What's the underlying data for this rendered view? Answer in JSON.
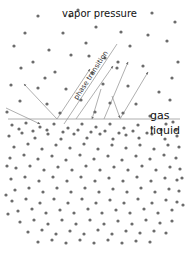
{
  "figure": {
    "width": 188,
    "height": 261,
    "background": "#ffffff",
    "title": "vapor pressure",
    "labels": {
      "title": "vapor pressure",
      "gas": "gas",
      "liquid": "liquid",
      "phase_transition": "phase transition"
    },
    "colors": {
      "particle": "#6b6b6b",
      "line": "#8d8d8d",
      "interface": "#9a9a9a",
      "text": "#111111",
      "background": "#ffffff"
    },
    "interface": {
      "name": "gas-liquid-interface",
      "y": 119,
      "x_start": 8,
      "x_end": 180
    },
    "particle_radius": 1.6,
    "gas_particles": [
      [
        38,
        16
      ],
      [
        70,
        16
      ],
      [
        152,
        13
      ],
      [
        25,
        33
      ],
      [
        63,
        33
      ],
      [
        121,
        32
      ],
      [
        148,
        35
      ],
      [
        175,
        22
      ],
      [
        49,
        50
      ],
      [
        86,
        43
      ],
      [
        105,
        58
      ],
      [
        167,
        41
      ],
      [
        14,
        46
      ],
      [
        33,
        62
      ],
      [
        130,
        46
      ],
      [
        178,
        62
      ],
      [
        78,
        10
      ],
      [
        96,
        27
      ],
      [
        21,
        68
      ],
      [
        55,
        72
      ],
      [
        92,
        73
      ],
      [
        117,
        68
      ],
      [
        143,
        66
      ],
      [
        172,
        78
      ],
      [
        11,
        85
      ],
      [
        38,
        88
      ],
      [
        66,
        89
      ],
      [
        103,
        84
      ],
      [
        128,
        86
      ],
      [
        159,
        92
      ],
      [
        20,
        101
      ],
      [
        47,
        104
      ],
      [
        81,
        100
      ],
      [
        110,
        103
      ],
      [
        136,
        104
      ],
      [
        170,
        100
      ],
      [
        7,
        112
      ],
      [
        60,
        113
      ],
      [
        95,
        112
      ],
      [
        123,
        113
      ],
      [
        150,
        116
      ],
      [
        118,
        62
      ],
      [
        89,
        56
      ],
      [
        45,
        78
      ],
      [
        71,
        55
      ]
    ],
    "liquid_particles": [
      [
        12,
        125
      ],
      [
        26,
        123
      ],
      [
        40,
        127
      ],
      [
        54,
        124
      ],
      [
        68,
        128
      ],
      [
        82,
        124
      ],
      [
        96,
        127
      ],
      [
        110,
        124
      ],
      [
        124,
        128
      ],
      [
        138,
        125
      ],
      [
        152,
        128
      ],
      [
        166,
        124
      ],
      [
        176,
        130
      ],
      [
        9,
        136
      ],
      [
        22,
        133
      ],
      [
        35,
        138
      ],
      [
        48,
        134
      ],
      [
        61,
        139
      ],
      [
        74,
        134
      ],
      [
        87,
        138
      ],
      [
        100,
        134
      ],
      [
        113,
        139
      ],
      [
        126,
        135
      ],
      [
        139,
        138
      ],
      [
        152,
        134
      ],
      [
        165,
        139
      ],
      [
        177,
        136
      ],
      [
        14,
        147
      ],
      [
        28,
        144
      ],
      [
        42,
        149
      ],
      [
        56,
        145
      ],
      [
        70,
        148
      ],
      [
        84,
        144
      ],
      [
        98,
        149
      ],
      [
        112,
        145
      ],
      [
        126,
        148
      ],
      [
        140,
        145
      ],
      [
        154,
        149
      ],
      [
        168,
        145
      ],
      [
        179,
        147
      ],
      [
        10,
        158
      ],
      [
        24,
        155
      ],
      [
        38,
        159
      ],
      [
        52,
        156
      ],
      [
        66,
        160
      ],
      [
        80,
        155
      ],
      [
        94,
        159
      ],
      [
        108,
        156
      ],
      [
        122,
        160
      ],
      [
        136,
        156
      ],
      [
        150,
        159
      ],
      [
        164,
        155
      ],
      [
        176,
        158
      ],
      [
        16,
        168
      ],
      [
        30,
        166
      ],
      [
        44,
        170
      ],
      [
        58,
        167
      ],
      [
        72,
        170
      ],
      [
        86,
        166
      ],
      [
        100,
        170
      ],
      [
        114,
        167
      ],
      [
        128,
        170
      ],
      [
        142,
        166
      ],
      [
        156,
        170
      ],
      [
        170,
        167
      ],
      [
        180,
        169
      ],
      [
        11,
        179
      ],
      [
        25,
        177
      ],
      [
        39,
        181
      ],
      [
        53,
        177
      ],
      [
        67,
        181
      ],
      [
        81,
        177
      ],
      [
        95,
        181
      ],
      [
        109,
        178
      ],
      [
        123,
        181
      ],
      [
        137,
        177
      ],
      [
        151,
        181
      ],
      [
        165,
        178
      ],
      [
        177,
        180
      ],
      [
        15,
        190
      ],
      [
        29,
        188
      ],
      [
        43,
        192
      ],
      [
        57,
        188
      ],
      [
        71,
        192
      ],
      [
        85,
        188
      ],
      [
        99,
        192
      ],
      [
        113,
        189
      ],
      [
        127,
        192
      ],
      [
        141,
        188
      ],
      [
        155,
        192
      ],
      [
        169,
        189
      ],
      [
        179,
        191
      ],
      [
        12,
        201
      ],
      [
        26,
        199
      ],
      [
        40,
        203
      ],
      [
        54,
        199
      ],
      [
        68,
        203
      ],
      [
        82,
        199
      ],
      [
        96,
        203
      ],
      [
        110,
        200
      ],
      [
        124,
        203
      ],
      [
        138,
        199
      ],
      [
        152,
        203
      ],
      [
        166,
        200
      ],
      [
        177,
        202
      ],
      [
        18,
        211
      ],
      [
        32,
        209
      ],
      [
        46,
        213
      ],
      [
        60,
        210
      ],
      [
        74,
        213
      ],
      [
        88,
        209
      ],
      [
        102,
        213
      ],
      [
        116,
        210
      ],
      [
        130,
        213
      ],
      [
        144,
        209
      ],
      [
        158,
        213
      ],
      [
        172,
        210
      ],
      [
        20,
        222
      ],
      [
        34,
        220
      ],
      [
        48,
        224
      ],
      [
        62,
        220
      ],
      [
        76,
        224
      ],
      [
        90,
        220
      ],
      [
        104,
        224
      ],
      [
        118,
        221
      ],
      [
        132,
        224
      ],
      [
        146,
        220
      ],
      [
        160,
        223
      ],
      [
        172,
        221
      ],
      [
        28,
        232
      ],
      [
        42,
        230
      ],
      [
        56,
        234
      ],
      [
        70,
        231
      ],
      [
        84,
        234
      ],
      [
        98,
        230
      ],
      [
        112,
        234
      ],
      [
        126,
        231
      ],
      [
        140,
        233
      ],
      [
        154,
        231
      ],
      [
        166,
        233
      ],
      [
        38,
        242
      ],
      [
        52,
        240
      ],
      [
        66,
        243
      ],
      [
        80,
        240
      ],
      [
        94,
        243
      ],
      [
        108,
        240
      ],
      [
        122,
        243
      ],
      [
        136,
        241
      ],
      [
        150,
        242
      ],
      [
        19,
        129
      ],
      [
        33,
        131
      ],
      [
        47,
        130
      ],
      [
        63,
        132
      ],
      [
        78,
        130
      ],
      [
        91,
        132
      ],
      [
        105,
        131
      ],
      [
        119,
        133
      ],
      [
        133,
        131
      ],
      [
        147,
        133
      ],
      [
        161,
        130
      ],
      [
        173,
        122
      ],
      [
        7,
        166
      ],
      [
        6,
        195
      ],
      [
        8,
        214
      ],
      [
        182,
        178
      ],
      [
        183,
        205
      ]
    ],
    "trajectories": [
      {
        "name": "evaporation-left",
        "x1": 57,
        "x2": 24,
        "y1": 119,
        "y2": 84,
        "arrow_at": "end"
      },
      {
        "name": "condensation-left",
        "x1": 6,
        "x2": 40,
        "y1": 108,
        "y2": 124,
        "arrow_at": "end"
      },
      {
        "name": "evaporation-mid-left",
        "x1": 57,
        "x2": 90,
        "y1": 119,
        "y2": 69,
        "arrow_at": "end"
      },
      {
        "name": "evaporation-steep",
        "x1": 76,
        "x2": 113,
        "y1": 119,
        "y2": 66,
        "arrow_at": "end"
      },
      {
        "name": "condensation-mid",
        "x1": 101,
        "x2": 92,
        "y1": 89,
        "y2": 119,
        "arrow_at": "end"
      },
      {
        "name": "evaporation-right",
        "x1": 104,
        "x2": 128,
        "y1": 119,
        "y2": 62,
        "arrow_at": "end"
      },
      {
        "name": "evaporation-far-right",
        "x1": 120,
        "x2": 148,
        "y1": 119,
        "y2": 72,
        "arrow_at": "end"
      },
      {
        "name": "condensation-right",
        "x1": 112,
        "x2": 120,
        "y1": 96,
        "y2": 118,
        "arrow_at": "end"
      },
      {
        "name": "phase-transition-guide",
        "x1": 64,
        "x2": 117,
        "y1": 124,
        "y2": 44,
        "arrow_at": "none"
      }
    ]
  }
}
